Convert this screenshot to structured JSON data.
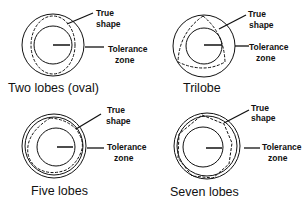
{
  "figure": {
    "panels": [
      {
        "title": "Two lobes (oval)",
        "lobes": 2,
        "callouts": {
          "true_shape": [
            "True",
            "shape"
          ],
          "tolerance_zone": [
            "Tolerance",
            "zone"
          ]
        }
      },
      {
        "title": "Trilobe",
        "lobes": 3,
        "callouts": {
          "true_shape": [
            "True",
            "shape"
          ],
          "tolerance_zone": [
            "Tolerance",
            "zone"
          ]
        }
      },
      {
        "title": "Five lobes",
        "lobes": 5,
        "callouts": {
          "true_shape": [
            "True",
            "shape"
          ],
          "tolerance_zone": [
            "Tolerance",
            "zone"
          ]
        }
      },
      {
        "title": "Seven lobes",
        "lobes": 7,
        "callouts": {
          "true_shape": [
            "True",
            "shape"
          ],
          "tolerance_zone": [
            "Tolerance",
            "zone"
          ]
        }
      }
    ],
    "colors": {
      "line": "#111111",
      "background": "#ffffff"
    }
  }
}
